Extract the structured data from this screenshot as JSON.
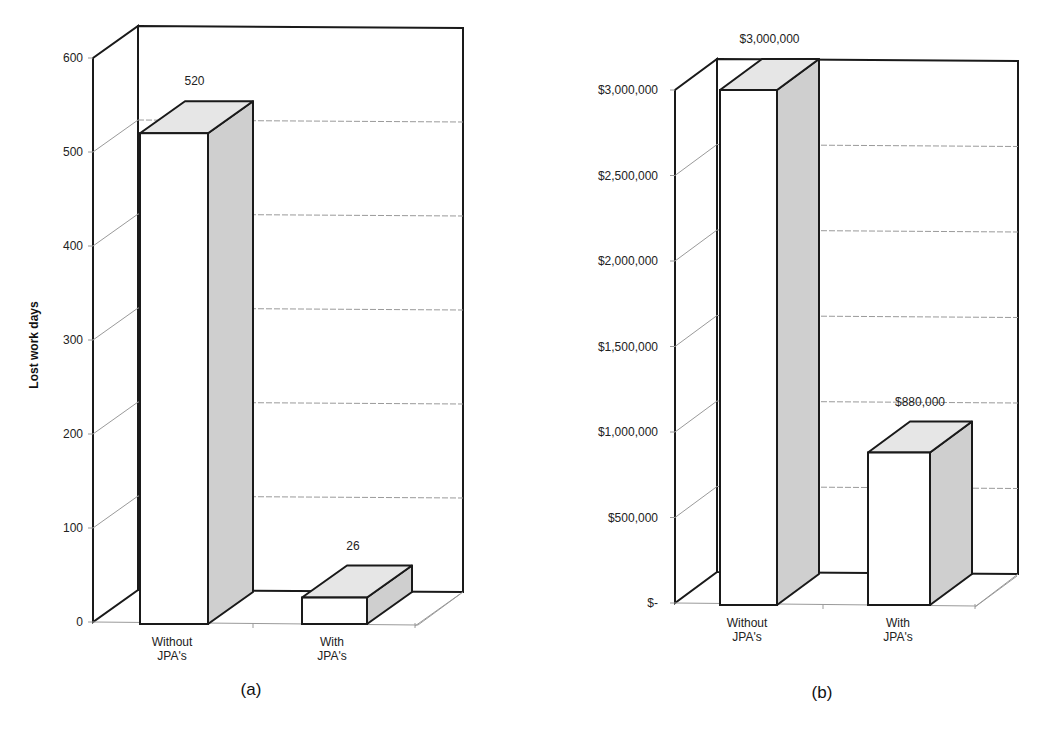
{
  "chart_data": [
    {
      "id": "a",
      "type": "bar",
      "style": "3d-column",
      "caption": "(a)",
      "title": "",
      "xlabel": "",
      "ylabel": "Lost work days",
      "categories": [
        "Without JPA's",
        "With JPA's"
      ],
      "category_lines": [
        [
          "Without",
          "JPA's"
        ],
        [
          "With",
          "JPA's"
        ]
      ],
      "values": [
        520,
        26
      ],
      "data_labels": [
        "520",
        "26"
      ],
      "ylim": [
        0,
        600
      ],
      "yticks": [
        0,
        100,
        200,
        300,
        400,
        500,
        600
      ],
      "ytick_labels": [
        "0",
        "100",
        "200",
        "300",
        "400",
        "500",
        "600"
      ],
      "grid": true,
      "legend": null
    },
    {
      "id": "b",
      "type": "bar",
      "style": "3d-column",
      "caption": "(b)",
      "title": "",
      "xlabel": "",
      "ylabel": "",
      "categories": [
        "Without JPA's",
        "With JPA's"
      ],
      "category_lines": [
        [
          "Without",
          "JPA's"
        ],
        [
          "With",
          "JPA's"
        ]
      ],
      "values": [
        3000000,
        880000
      ],
      "data_labels": [
        "$3,000,000",
        "$880,000"
      ],
      "ylim": [
        0,
        3000000
      ],
      "yticks": [
        0,
        500000,
        1000000,
        1500000,
        2000000,
        2500000,
        3000000
      ],
      "ytick_labels": [
        "$-",
        "$500,000",
        "$1,000,000",
        "$1,500,000",
        "$2,000,000",
        "$2,500,000",
        "$3,000,000"
      ],
      "grid": true,
      "legend": null
    }
  ],
  "colors": {
    "bar_front": "#ffffff",
    "bar_top": "#e6e6e6",
    "bar_side": "#cfcfcf",
    "outline": "#1a1a1a",
    "grid": "#9a9a9a"
  }
}
